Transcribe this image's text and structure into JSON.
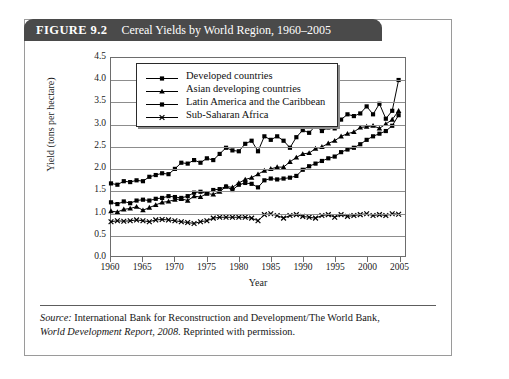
{
  "figure": {
    "label": "FIGURE 9.2",
    "title": "Cereal Yields by World Region, 1960–2005"
  },
  "source": {
    "lead": "Source:",
    "line1_rest": " International Bank for Reconstruction and Development/The World Bank,",
    "line2_italic": "World Development Report, 2008",
    "line2_rest": ". Reprinted with permission."
  },
  "chart_data": {
    "type": "line",
    "title": "Cereal Yields by World Region, 1960–2005",
    "xlabel": "Year",
    "ylabel": "Yield (tons per hectare)",
    "xlim": [
      1960,
      2006
    ],
    "ylim": [
      0.0,
      4.5
    ],
    "grid": true,
    "legend_position": "top-left-inside",
    "ytick_labels": [
      "4.5",
      "4.0",
      "3.5",
      "3.0",
      "2.5",
      "2.0",
      "1.5",
      "1.0",
      "0.5",
      "0.0"
    ],
    "ytick_values": [
      4.5,
      4.0,
      3.5,
      3.0,
      2.5,
      2.0,
      1.5,
      1.0,
      0.5,
      0.0
    ],
    "xtick_labels": [
      "1960",
      "1965",
      "1970",
      "1975",
      "1980",
      "1985",
      "1990",
      "1995",
      "2000",
      "2005"
    ],
    "xtick_values": [
      1960,
      1965,
      1970,
      1975,
      1980,
      1985,
      1990,
      1995,
      2000,
      2005
    ],
    "x": [
      1960,
      1961,
      1962,
      1963,
      1964,
      1965,
      1966,
      1967,
      1968,
      1969,
      1970,
      1971,
      1972,
      1973,
      1974,
      1975,
      1976,
      1977,
      1978,
      1979,
      1980,
      1981,
      1982,
      1983,
      1984,
      1985,
      1986,
      1987,
      1988,
      1989,
      1990,
      1991,
      1992,
      1993,
      1994,
      1995,
      1996,
      1997,
      1998,
      1999,
      2000,
      2001,
      2002,
      2003,
      2004,
      2005
    ],
    "series": [
      {
        "name": "Developed countries",
        "marker": "diamond",
        "values": [
          1.65,
          1.62,
          1.7,
          1.68,
          1.72,
          1.7,
          1.8,
          1.84,
          1.88,
          1.86,
          1.98,
          2.12,
          2.1,
          2.18,
          2.12,
          2.22,
          2.18,
          2.32,
          2.46,
          2.4,
          2.38,
          2.55,
          2.62,
          2.38,
          2.72,
          2.64,
          2.72,
          2.62,
          2.46,
          2.7,
          2.86,
          2.8,
          2.96,
          2.84,
          2.92,
          2.9,
          3.1,
          3.22,
          3.18,
          3.24,
          3.4,
          3.22,
          3.46,
          3.12,
          3.3,
          4.0
        ]
      },
      {
        "name": "Asian developing countries",
        "marker": "triangle",
        "values": [
          1.02,
          1.0,
          1.06,
          1.08,
          1.12,
          1.04,
          1.1,
          1.16,
          1.22,
          1.24,
          1.28,
          1.3,
          1.26,
          1.36,
          1.34,
          1.42,
          1.4,
          1.46,
          1.58,
          1.56,
          1.66,
          1.74,
          1.78,
          1.86,
          1.94,
          1.98,
          2.02,
          2.02,
          2.14,
          2.24,
          2.32,
          2.34,
          2.44,
          2.48,
          2.56,
          2.62,
          2.72,
          2.78,
          2.82,
          2.92,
          2.94,
          2.96,
          2.9,
          3.0,
          3.1,
          3.3
        ]
      },
      {
        "name": "Latin America and the Caribbean",
        "marker": "square",
        "values": [
          1.22,
          1.18,
          1.24,
          1.2,
          1.26,
          1.28,
          1.26,
          1.3,
          1.32,
          1.36,
          1.34,
          1.32,
          1.36,
          1.44,
          1.46,
          1.42,
          1.5,
          1.52,
          1.58,
          1.5,
          1.62,
          1.66,
          1.64,
          1.56,
          1.72,
          1.76,
          1.74,
          1.76,
          1.78,
          1.82,
          1.96,
          2.04,
          2.1,
          2.16,
          2.22,
          2.26,
          2.36,
          2.42,
          2.46,
          2.54,
          2.64,
          2.72,
          2.78,
          2.84,
          2.96,
          3.2
        ]
      },
      {
        "name": "Sub-Saharan Africa",
        "marker": "cross",
        "values": [
          0.78,
          0.8,
          0.79,
          0.8,
          0.82,
          0.8,
          0.78,
          0.82,
          0.83,
          0.82,
          0.8,
          0.78,
          0.76,
          0.74,
          0.78,
          0.8,
          0.86,
          0.88,
          0.88,
          0.88,
          0.88,
          0.88,
          0.86,
          0.8,
          0.94,
          0.96,
          0.92,
          0.86,
          0.92,
          0.94,
          0.9,
          0.88,
          0.86,
          0.92,
          0.94,
          0.88,
          0.94,
          0.9,
          0.92,
          0.94,
          0.96,
          0.92,
          0.94,
          0.92,
          0.96,
          0.95
        ]
      }
    ]
  }
}
